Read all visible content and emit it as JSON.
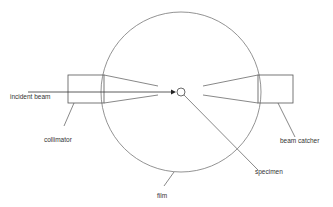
{
  "diagram": {
    "labels": {
      "incident_beam": "incident beam",
      "collimator": "collimator",
      "beam_catcher": "beam catcher",
      "specimen": "specimen",
      "film": "film"
    },
    "colors": {
      "stroke": "#555555",
      "text": "#333333",
      "background": "#ffffff"
    }
  }
}
